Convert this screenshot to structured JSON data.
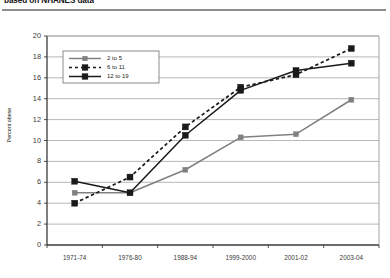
{
  "figure": {
    "title": "based on NHANES data",
    "y_axis_title": "Percent obese"
  },
  "legend": {
    "entries": [
      {
        "label": "2 to 5",
        "color": "#808080",
        "style": "solid",
        "marker": "square"
      },
      {
        "label": "6 to 11",
        "color": "#1a1a1a",
        "style": "dashed",
        "marker": "square"
      },
      {
        "label": "12 to 19",
        "color": "#1a1a1a",
        "style": "solid",
        "marker": "square"
      }
    ]
  },
  "chart_data": {
    "type": "line",
    "title": "based on NHANES data",
    "xlabel": "",
    "ylabel": "Percent obese",
    "ylim": [
      0,
      20
    ],
    "ytick_step": 2,
    "yticks": [
      0,
      2,
      4,
      6,
      8,
      10,
      12,
      14,
      16,
      18,
      20
    ],
    "grid": "horizontal",
    "legend_position": "top-left-inside",
    "categories": [
      "1971-74",
      "1976-80",
      "1988-94",
      "1999-2000",
      "2001-02",
      "2003-04"
    ],
    "series": [
      {
        "name": "2 to 5",
        "color": "#808080",
        "style": "solid",
        "marker": "square",
        "values": [
          5.0,
          5.0,
          7.2,
          10.3,
          10.6,
          13.9
        ]
      },
      {
        "name": "6 to 11",
        "color": "#1a1a1a",
        "style": "dashed",
        "marker": "square",
        "values": [
          4.0,
          6.5,
          11.3,
          15.1,
          16.3,
          18.8
        ]
      },
      {
        "name": "12 to 19",
        "color": "#1a1a1a",
        "style": "solid",
        "marker": "square",
        "values": [
          6.1,
          5.0,
          10.5,
          14.8,
          16.7,
          17.4
        ]
      }
    ]
  }
}
